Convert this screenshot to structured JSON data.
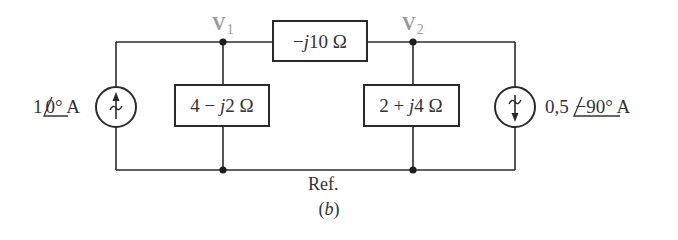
{
  "figure": {
    "caption": "(b)",
    "caption_letter": "b",
    "reference_label": "Ref."
  },
  "nodes": {
    "v1": {
      "label": "V",
      "subscript": "1"
    },
    "v2": {
      "label": "V",
      "subscript": "2"
    }
  },
  "components": {
    "z_series": {
      "prefix": "−",
      "j": "j",
      "value": "10 Ω"
    },
    "z_left": {
      "pre": "4 − ",
      "j": "j",
      "value": "2 Ω"
    },
    "z_right": {
      "pre": "2 + ",
      "j": "j",
      "value": "4 Ω"
    },
    "source_left": {
      "magnitude": "1",
      "angle": "0°",
      "unit": " A",
      "direction": "up"
    },
    "source_right": {
      "magnitude": "0,5 ",
      "angle": "−90°",
      "unit": " A",
      "direction": "down"
    }
  },
  "colors": {
    "line": "#2a2a2a",
    "node_label": "#9a9a9a",
    "text": "#333333"
  }
}
